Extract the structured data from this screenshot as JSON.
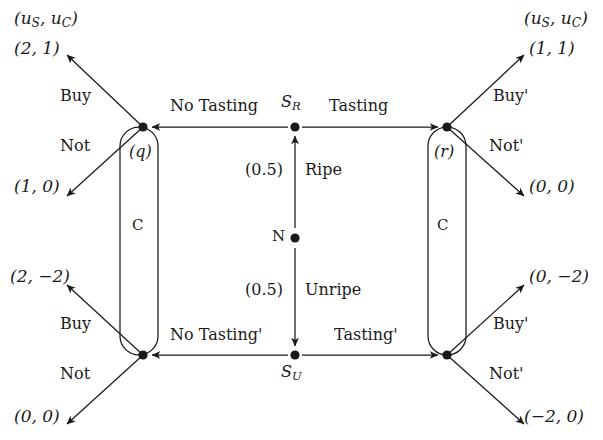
{
  "diagram": {
    "title_left": "(uS, uC)",
    "title_right": "(uS, uC)",
    "nature": {
      "node_label": "N",
      "branches": [
        {
          "name": "Ripe",
          "probability": "(0.5)",
          "to": "SR"
        },
        {
          "name": "Unripe",
          "probability": "(0.5)",
          "to": "SU"
        }
      ]
    },
    "seller_nodes": [
      {
        "id": "SR",
        "label_main": "S",
        "label_sub": "R"
      },
      {
        "id": "SU",
        "label_main": "S",
        "label_sub": "U"
      }
    ],
    "seller_actions": {
      "top_left": "No Tasting",
      "top_right": "Tasting",
      "bottom_left": "No Tasting'",
      "bottom_right": "Tasting'"
    },
    "info_sets": [
      {
        "id": "left",
        "player": "C",
        "belief": "(q)"
      },
      {
        "id": "right",
        "player": "C",
        "belief": "(r)"
      }
    ],
    "terminal_nodes": [
      {
        "id": "tl-buy",
        "action": "Buy",
        "payoff": "(2, 1)"
      },
      {
        "id": "tl-not",
        "action": "Not",
        "payoff": "(1, 0)"
      },
      {
        "id": "tr-buy",
        "action": "Buy'",
        "payoff": "(1, 1)"
      },
      {
        "id": "tr-not",
        "action": "Not'",
        "payoff": "(0, 0)"
      },
      {
        "id": "bl-buy",
        "action": "Buy",
        "payoff": "(2, −2)"
      },
      {
        "id": "bl-not",
        "action": "Not",
        "payoff": "(0, 0)"
      },
      {
        "id": "br-buy",
        "action": "Buy'",
        "payoff": "(0, −2)"
      },
      {
        "id": "br-not",
        "action": "Not'",
        "payoff": "(−2, 0)"
      }
    ],
    "colors": {
      "ink": "#1a1a1a",
      "background": "#ffffff"
    }
  }
}
